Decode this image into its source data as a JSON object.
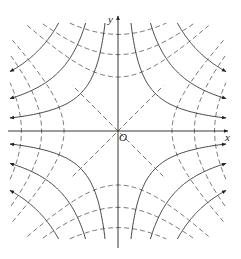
{
  "figure": {
    "labels": {
      "x_axis": "x",
      "y_axis": "y",
      "origin": "O"
    },
    "colors": {
      "line": "#333333",
      "dashed": "#555555",
      "background": "#ffffff"
    },
    "solid_constants": [
      0.12,
      0.3,
      0.55
    ],
    "dashed_constants": [
      0.25,
      0.5,
      0.8
    ],
    "has_diagonals": true
  }
}
